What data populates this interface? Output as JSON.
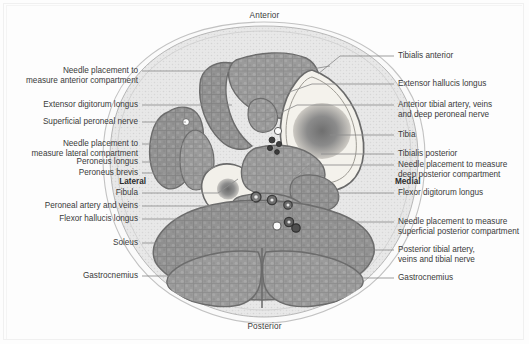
{
  "figure": {
    "type": "anatomical-cross-section",
    "region": "lower leg (mid-calf) axial cross-section",
    "orientation": {
      "anterior": "Anterior",
      "posterior": "Posterior",
      "lateral": "Lateral",
      "medial": "Medial"
    }
  },
  "labels_left": [
    {
      "id": "needle-anterior-compartment",
      "lines": [
        "Needle placement to",
        "measure anterior compartment"
      ],
      "text_x": 138,
      "text_y": 66,
      "leader": [
        [
          142,
          71
        ],
        [
          300,
          71
        ],
        [
          330,
          66
        ]
      ]
    },
    {
      "id": "extensor-digitorum-longus",
      "lines": [
        "Extensor digitorum longus"
      ],
      "text_x": 138,
      "text_y": 100,
      "leader": [
        [
          142,
          105
        ],
        [
          232,
          105
        ]
      ]
    },
    {
      "id": "superficial-peroneal-nerve",
      "lines": [
        "Superficial peroneal nerve"
      ],
      "text_x": 138,
      "text_y": 117,
      "leader": [
        [
          142,
          122
        ],
        [
          186,
          122
        ]
      ]
    },
    {
      "id": "needle-lateral-compartment",
      "lines": [
        "Needle placement to",
        "measure lateral compartment"
      ],
      "text_x": 138,
      "text_y": 139,
      "leader": [
        [
          142,
          144
        ],
        [
          205,
          144
        ]
      ]
    },
    {
      "id": "peroneus-longus",
      "lines": [
        "Peroneus longus"
      ],
      "text_x": 138,
      "text_y": 157,
      "leader": [
        [
          142,
          162
        ],
        [
          186,
          162
        ]
      ]
    },
    {
      "id": "peroneus-brevis",
      "lines": [
        "Peroneus brevis"
      ],
      "text_x": 138,
      "text_y": 168,
      "leader": [
        [
          142,
          173
        ],
        [
          203,
          173
        ],
        [
          216,
          166
        ]
      ]
    },
    {
      "id": "fibula",
      "lines": [
        "Fibula"
      ],
      "text_x": 138,
      "text_y": 188,
      "leader": [
        [
          142,
          193
        ],
        [
          218,
          193
        ],
        [
          238,
          179
        ]
      ]
    },
    {
      "id": "peroneal-artery-and-veins",
      "lines": [
        "Peroneal artery and veins"
      ],
      "text_x": 138,
      "text_y": 201,
      "leader": [
        [
          142,
          206
        ],
        [
          243,
          206
        ],
        [
          258,
          199
        ]
      ]
    },
    {
      "id": "flexor-hallucis-longus",
      "lines": [
        "Flexor hallucis longus"
      ],
      "text_x": 138,
      "text_y": 214,
      "leader": [
        [
          142,
          219
        ],
        [
          272,
          219
        ]
      ]
    },
    {
      "id": "soleus",
      "lines": [
        "Soleus"
      ],
      "text_x": 138,
      "text_y": 238,
      "leader": [
        [
          142,
          243
        ],
        [
          230,
          243
        ]
      ]
    },
    {
      "id": "gastrocnemius-left",
      "lines": [
        "Gastrocnemius"
      ],
      "text_x": 138,
      "text_y": 271,
      "leader": [
        [
          142,
          276
        ],
        [
          258,
          276
        ]
      ]
    }
  ],
  "labels_right": [
    {
      "id": "tibialis-anterior",
      "lines": [
        "Tibialis anterior"
      ],
      "text_x": 398,
      "text_y": 51,
      "leader": [
        [
          394,
          56
        ],
        [
          340,
          56
        ],
        [
          318,
          74
        ]
      ]
    },
    {
      "id": "extensor-hallucis-longus",
      "lines": [
        "Extensor hallucis longus"
      ],
      "text_x": 398,
      "text_y": 79,
      "leader": [
        [
          394,
          84
        ],
        [
          312,
          84
        ],
        [
          278,
          96
        ]
      ]
    },
    {
      "id": "anterior-tibial-artery-veins-deep-peroneal-nerve",
      "lines": [
        "Anterior tibial artery, veins",
        "and deep peroneal nerve"
      ],
      "text_x": 398,
      "text_y": 100,
      "leader": [
        [
          394,
          105
        ],
        [
          297,
          105
        ],
        [
          261,
          122
        ]
      ]
    },
    {
      "id": "tibia",
      "lines": [
        "Tibia"
      ],
      "text_x": 398,
      "text_y": 130,
      "leader": [
        [
          394,
          135
        ],
        [
          330,
          135
        ]
      ]
    },
    {
      "id": "tibialis-posterior",
      "lines": [
        "Tibialis posterior"
      ],
      "text_x": 398,
      "text_y": 149,
      "leader": [
        [
          394,
          154
        ],
        [
          321,
          154
        ]
      ]
    },
    {
      "id": "needle-deep-posterior-compartment",
      "lines": [
        "Needle placement to measure",
        "deep posterior compartment"
      ],
      "text_x": 398,
      "text_y": 160,
      "leader": [
        [
          394,
          165
        ],
        [
          309,
          165
        ],
        [
          292,
          180
        ]
      ]
    },
    {
      "id": "flexor-digitorum-longus",
      "lines": [
        "Flexor digitorum longus"
      ],
      "text_x": 398,
      "text_y": 188,
      "leader": [
        [
          394,
          193
        ],
        [
          320,
          193
        ]
      ]
    },
    {
      "id": "needle-superficial-posterior-compartment",
      "lines": [
        "Needle placement to measure",
        "superficial posterior compartment"
      ],
      "text_x": 398,
      "text_y": 217,
      "leader": [
        [
          394,
          222
        ],
        [
          300,
          222
        ],
        [
          290,
          206
        ]
      ]
    },
    {
      "id": "posterior-tibial-artery-veins-tibial-nerve",
      "lines": [
        "Posterior tibial artery,",
        "veins and tibial nerve"
      ],
      "text_x": 398,
      "text_y": 245,
      "leader": [
        [
          394,
          250
        ],
        [
          330,
          250
        ]
      ]
    },
    {
      "id": "gastrocnemius-right",
      "lines": [
        "Gastrocnemius"
      ],
      "text_x": 398,
      "text_y": 273,
      "leader": [
        [
          394,
          278
        ],
        [
          305,
          278
        ]
      ]
    }
  ],
  "colors": {
    "page_background": "#fdfdfd",
    "skin_outline": "#b4b4b4",
    "subcutaneous_fat": "#e7e7e7",
    "muscle_fill": "#9d9d9d",
    "muscle_fill_dark": "#8f8f8f",
    "fascia_line": "#6d6d6d",
    "bone_cortex": "#f4f2ee",
    "bone_marrow": "#8a8a8a",
    "vessel_dark": "#4a4a4a",
    "nerve_light": "#fdfdfd",
    "leader_line": "#8c8c8c",
    "label_text": "#3a3a3a"
  }
}
